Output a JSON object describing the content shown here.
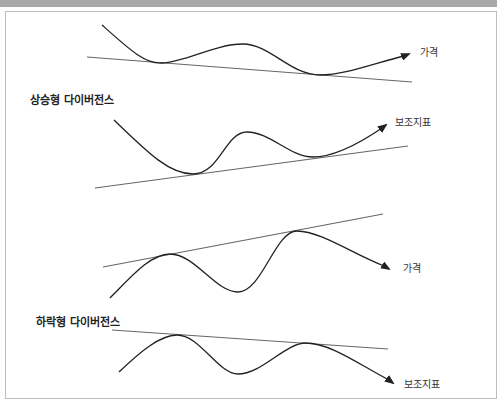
{
  "sections": [
    {
      "title": "상승형 다이버전스",
      "panels": [
        {
          "label": "가격",
          "curve": "M102,25 C130,50 145,64 162,63 C185,62 215,44 243,44 C270,44 290,75 320,75 C345,75 375,63 404,56",
          "arrow_tip": [
            409,
            54
          ],
          "trend": [
            87,
            57,
            412,
            82
          ],
          "label_pos": [
            420,
            44
          ]
        },
        {
          "label": "보조지표",
          "curve": "M114,120 C150,155 170,174 193,174 C220,174 225,132 247,132 C270,132 290,157 313,157 C335,157 360,143 382,128",
          "arrow_tip": [
            386,
            125
          ],
          "trend": [
            95,
            188,
            408,
            146
          ],
          "label_pos": [
            395,
            114
          ]
        }
      ]
    },
    {
      "title": "하락형 다이버전스",
      "panels": [
        {
          "label": "가격",
          "curve": "M110,298 C130,278 150,254 170,254 C195,254 215,292 238,292 C262,292 275,231 297,231 C320,231 355,255 384,266",
          "arrow_tip": [
            389,
            269
          ],
          "trend": [
            103,
            267,
            383,
            214
          ],
          "label_pos": [
            403,
            260
          ]
        },
        {
          "label": "보조지표",
          "curve": "M119,372 C140,352 160,335 177,335 C200,335 218,374 238,374 C262,374 285,343 306,343 C330,343 360,365 389,380",
          "arrow_tip": [
            393,
            383
          ],
          "trend": [
            112,
            330,
            388,
            349
          ],
          "label_pos": [
            404,
            376
          ]
        }
      ]
    }
  ],
  "colors": {
    "curve": "#222222",
    "trend": "#666666",
    "band": "#a9a9a9",
    "frame_border": "#bdbdbd"
  }
}
